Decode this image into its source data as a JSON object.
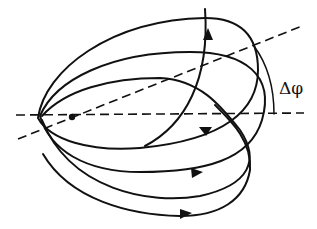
{
  "diagram": {
    "type": "precessing-orbit",
    "angle_label": "Δφ",
    "colors": {
      "stroke": "#111111",
      "background": "#ffffff"
    },
    "reference_lines": [
      {
        "name": "horizontal-axis",
        "style": "dashed"
      },
      {
        "name": "rotated-axis",
        "style": "dashed"
      }
    ],
    "orbit_loops": 4,
    "arrow_count": 4,
    "center_point": "dot"
  }
}
